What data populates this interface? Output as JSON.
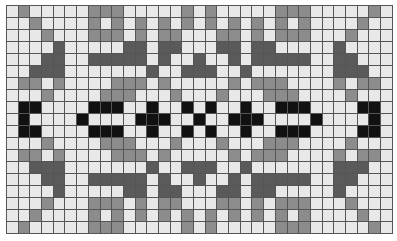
{
  "grid": {
    "columns": 33,
    "rows": 19,
    "legend": {
      "L": {
        "name": "light",
        "color": "#e8e8e8"
      },
      "G": {
        "name": "medium-gray",
        "color": "#8c8c8c"
      },
      "D": {
        "name": "dark-gray",
        "color": "#5a5a5a"
      },
      "B": {
        "name": "black",
        "color": "#111111"
      }
    },
    "quadrant_top_left": [
      "LGLLLLLGGGLLLLLGL",
      "LLGLLLLGLGLGLGLGL",
      "LLLGLLLGGGLGLGGLL",
      "LLLLDLLLLLDDLDDLL",
      "LLLDDLLDDDDDLDLLD",
      "LLDDDLLLLLLLDLLDD",
      "LGGLGLLLLGGGLGLLL",
      "LLLGLLLLGGGLLLGLL",
      "LBBLLLLBBBLLBLLBL",
      "LBLLLLBLLLLBBBLLB"
    ],
    "symmetry": "mirror-horizontal-about-col-16 and mirror-vertical-about-row-9"
  }
}
